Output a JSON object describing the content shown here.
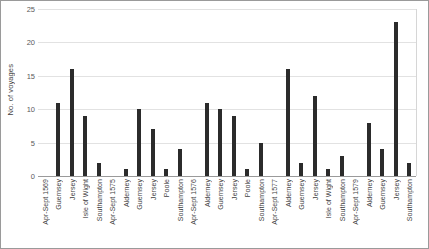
{
  "chart_data": {
    "type": "bar",
    "title": "",
    "xlabel": "",
    "ylabel": "No. of voyages",
    "ylim": [
      0,
      25
    ],
    "ytick_values": [
      0,
      5,
      10,
      15,
      20,
      25
    ],
    "ytick_labels": [
      "0",
      "5",
      "10",
      "15",
      "20",
      "25"
    ],
    "grid": true,
    "legend": "none",
    "bar_color": "#2b2b2b",
    "gridline_color": "#e2e2e2",
    "axis_color": "#9a9a9a",
    "categories": [
      "Apr-Sept 1569",
      "Guernsey",
      "Jersey",
      "Isle of Wight",
      "Southampton",
      "Apr-Sept 1575",
      "Alderney",
      "Guernsey",
      "Jersey",
      "Poole",
      "Southampton",
      "Apr-Sept 1576",
      "Alderney",
      "Guernsey",
      "Jersey",
      "Poole",
      "Southampton",
      "Apr-Sept 1577",
      "Alderney",
      "Guernsey",
      "Jersey",
      "Isle of Wight",
      "Southampton",
      "Apr-Sept 1579",
      "Alderney",
      "Guernsey",
      "Jersey",
      "Southampton"
    ],
    "values": [
      0,
      11,
      16,
      9,
      2,
      0,
      1,
      10,
      7,
      1,
      4,
      0,
      11,
      10,
      9,
      1,
      5,
      0,
      16,
      2,
      12,
      1,
      3,
      0,
      8,
      4,
      23,
      2
    ],
    "groups": [
      {
        "period": "Apr-Sept 1569",
        "ports": [
          "Guernsey",
          "Jersey",
          "Isle of Wight",
          "Southampton"
        ],
        "values": [
          11,
          16,
          9,
          2
        ]
      },
      {
        "period": "Apr-Sept 1575",
        "ports": [
          "Alderney",
          "Guernsey",
          "Jersey",
          "Poole",
          "Southampton"
        ],
        "values": [
          1,
          10,
          7,
          1,
          4
        ]
      },
      {
        "period": "Apr-Sept 1576",
        "ports": [
          "Alderney",
          "Guernsey",
          "Jersey",
          "Poole",
          "Southampton"
        ],
        "values": [
          11,
          10,
          9,
          1,
          5
        ]
      },
      {
        "period": "Apr-Sept 1577",
        "ports": [
          "Alderney",
          "Guernsey",
          "Jersey",
          "Isle of Wight",
          "Southampton"
        ],
        "values": [
          16,
          2,
          12,
          1,
          3
        ]
      },
      {
        "period": "Apr-Sept 1579",
        "ports": [
          "Alderney",
          "Guernsey",
          "Jersey",
          "Southampton"
        ],
        "values": [
          8,
          4,
          23,
          2
        ]
      }
    ]
  }
}
